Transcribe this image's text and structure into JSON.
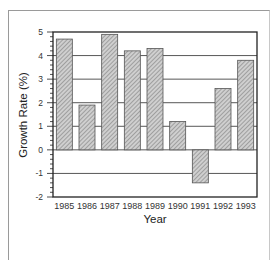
{
  "chart_data": {
    "type": "bar",
    "title": "",
    "xlabel": "Year",
    "ylabel": "Growth Rate (%)",
    "categories": [
      "1985",
      "1986",
      "1987",
      "1988",
      "1989",
      "1990",
      "1991",
      "1992",
      "1993"
    ],
    "values": [
      4.7,
      1.9,
      4.9,
      4.2,
      4.3,
      1.2,
      -1.4,
      2.6,
      3.8
    ],
    "ylim": [
      -2,
      5
    ],
    "yticks": [
      5,
      4,
      3,
      2,
      1,
      0,
      -1,
      -2
    ],
    "grid": "horizontal",
    "legend": "none",
    "bar_fill": "diagonal-hatch gray"
  },
  "colors": {
    "bar_fill": "#bdbdbd",
    "bar_hatch": "#8a8a8a",
    "bar_border": "#555555",
    "axis": "#222222",
    "grid": "#444444",
    "frame": "#9a9a9a"
  }
}
